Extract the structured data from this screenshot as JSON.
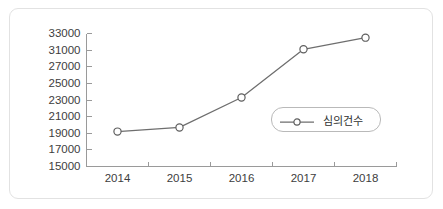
{
  "chart_data": {
    "type": "line",
    "title": "",
    "subtitle": "",
    "xlabel": "",
    "ylabel": "",
    "categories": [
      "2014",
      "2015",
      "2016",
      "2017",
      "2018"
    ],
    "series": [
      {
        "name": "심의건수",
        "values": [
          19200,
          19700,
          23300,
          31100,
          32500
        ],
        "color": "#6e6e6e",
        "marker": "open-circle"
      }
    ],
    "ytick_labels": [
      "33000",
      "31000",
      "27000",
      "25000",
      "23000",
      "21000",
      "19000",
      "17000",
      "15000"
    ],
    "xtick_labels": [
      "2014",
      "2015",
      "2016",
      "2017",
      "2018"
    ],
    "grid": false,
    "legend_position": "center-right",
    "legend_entries": [
      "심의건수"
    ],
    "axis_color": "#9a9a9a",
    "frame_color": "#e2e2e2",
    "background_color": "#ffffff",
    "text_color": "#3d3d3d"
  },
  "legend": {
    "label": "심의건수",
    "marker_name": "open-circle-marker"
  },
  "axes": {
    "y_labels": [
      "33000",
      "31000",
      "27000",
      "25000",
      "23000",
      "21000",
      "19000",
      "17000",
      "15000"
    ],
    "x_labels": [
      "2014",
      "2015",
      "2016",
      "2017",
      "2018"
    ]
  }
}
